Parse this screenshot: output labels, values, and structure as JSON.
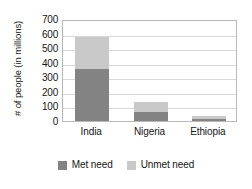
{
  "chart_data": {
    "type": "bar",
    "subtype": "stacked-vertical",
    "title": "",
    "xlabel": "",
    "ylabel": "# of people (in millions)",
    "categories": [
      "India",
      "Nigeria",
      "Ethiopia"
    ],
    "series": [
      {
        "name": "Met need",
        "color": "#838383",
        "values": [
          355,
          60,
          15
        ]
      },
      {
        "name": "Unmet need",
        "color": "#c9c9c9",
        "values": [
          225,
          70,
          20
        ]
      }
    ],
    "totals": [
      580,
      130,
      35
    ],
    "ylim": [
      0,
      700
    ],
    "ytick_step": 100,
    "yticks": [
      700,
      600,
      500,
      400,
      300,
      200,
      100,
      0
    ],
    "ytick_labels": [
      "700",
      "600",
      "500",
      "400",
      "300",
      "200",
      "100",
      "0"
    ],
    "grid": true,
    "grid_axis": "y",
    "legend_position": "bottom",
    "legend_entries": [
      "Met need",
      "Unmet need"
    ],
    "frame": true,
    "frame_color": "#b8b8b8",
    "grid_color": "#d8d8d8",
    "background": "#ffffff"
  },
  "axis": {
    "y_title": "# of people (in millions)"
  }
}
